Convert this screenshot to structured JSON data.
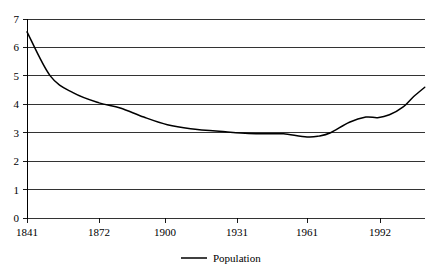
{
  "chart_data": {
    "type": "line",
    "title": "",
    "xlabel": "",
    "ylabel": "",
    "ylim": [
      0,
      7
    ],
    "xlim": [
      1841,
      2011
    ],
    "grid": true,
    "legend_position": "bottom",
    "y_ticks": [
      "0",
      "1",
      "2",
      "3",
      "4",
      "5",
      "6",
      "7"
    ],
    "y_tick_values": [
      0,
      1,
      2,
      3,
      4,
      5,
      6,
      7
    ],
    "x_ticks": [
      "1841",
      "1872",
      "1900",
      "1931",
      "1961",
      "1992"
    ],
    "x_tick_values": [
      1841,
      1872,
      1900,
      1931,
      1961,
      1992
    ],
    "series": [
      {
        "name": "Population",
        "color": "#000000",
        "x": [
          1841,
          1851,
          1861,
          1872,
          1881,
          1891,
          1901,
          1911,
          1926,
          1936,
          1946,
          1951,
          1961,
          1966,
          1971,
          1979,
          1986,
          1991,
          1996,
          2002,
          2006,
          2011
        ],
        "values": [
          6.55,
          5.0,
          4.4,
          4.05,
          3.87,
          3.55,
          3.28,
          3.14,
          3.03,
          2.97,
          2.96,
          2.96,
          2.85,
          2.88,
          3.0,
          3.37,
          3.55,
          3.53,
          3.63,
          3.92,
          4.25,
          4.6
        ]
      }
    ],
    "legend": [
      {
        "label": "Population",
        "color": "#000000"
      }
    ]
  },
  "legend": {
    "population_label": "Population"
  },
  "axes": {
    "y": {
      "t0": "0",
      "t1": "1",
      "t2": "2",
      "t3": "3",
      "t4": "4",
      "t5": "5",
      "t6": "6",
      "t7": "7"
    },
    "x": {
      "t0": "1841",
      "t1": "1872",
      "t2": "1900",
      "t3": "1931",
      "t4": "1961",
      "t5": "1992"
    }
  }
}
